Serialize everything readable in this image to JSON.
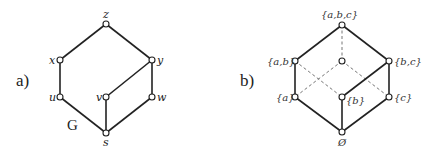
{
  "figure": {
    "panel_a": {
      "label": "a)",
      "graph_name": "G",
      "nodes": [
        {
          "id": "z",
          "label": "z",
          "x": 106,
          "y": 24
        },
        {
          "id": "x",
          "label": "x",
          "x": 60,
          "y": 60
        },
        {
          "id": "y",
          "label": "y",
          "x": 152,
          "y": 60
        },
        {
          "id": "u",
          "label": "u",
          "x": 60,
          "y": 97
        },
        {
          "id": "v",
          "label": "v",
          "x": 106,
          "y": 97
        },
        {
          "id": "w",
          "label": "w",
          "x": 152,
          "y": 97
        },
        {
          "id": "s",
          "label": "s",
          "x": 106,
          "y": 133
        }
      ],
      "edges": [
        [
          "z",
          "x"
        ],
        [
          "z",
          "y"
        ],
        [
          "x",
          "u"
        ],
        [
          "y",
          "v"
        ],
        [
          "y",
          "w"
        ],
        [
          "u",
          "s"
        ],
        [
          "v",
          "s"
        ],
        [
          "w",
          "s"
        ]
      ]
    },
    "panel_b": {
      "label": "b)",
      "nodes": [
        {
          "id": "abc",
          "label": "{a,b,c}",
          "x": 342,
          "y": 25
        },
        {
          "id": "ab",
          "label": "{a,b}",
          "x": 295,
          "y": 61
        },
        {
          "id": "ac",
          "label": "",
          "x": 342,
          "y": 61
        },
        {
          "id": "bc",
          "label": "{b,c}",
          "x": 389,
          "y": 61
        },
        {
          "id": "a",
          "label": "{a}",
          "x": 295,
          "y": 97
        },
        {
          "id": "b",
          "label": "{b}",
          "x": 342,
          "y": 97
        },
        {
          "id": "c",
          "label": "{c}",
          "x": 389,
          "y": 97
        },
        {
          "id": "empty",
          "label": "Ø",
          "x": 342,
          "y": 132
        }
      ],
      "solid_edges": [
        [
          "abc",
          "ab"
        ],
        [
          "abc",
          "bc"
        ],
        [
          "ab",
          "a"
        ],
        [
          "bc",
          "b"
        ],
        [
          "bc",
          "c"
        ],
        [
          "a",
          "empty"
        ],
        [
          "b",
          "empty"
        ],
        [
          "c",
          "empty"
        ]
      ],
      "dashed_edges": [
        [
          "abc",
          "ac"
        ],
        [
          "ab",
          "b"
        ],
        [
          "ac",
          "a"
        ],
        [
          "ac",
          "c"
        ]
      ]
    }
  }
}
